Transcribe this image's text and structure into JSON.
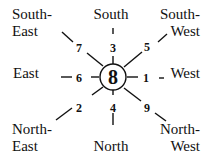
{
  "diagram": {
    "center": {
      "label": "8"
    },
    "directions": {
      "south_east": [
        "South-",
        "East"
      ],
      "south": "South",
      "south_west": [
        "South-",
        "West"
      ],
      "east": "East",
      "west": "West",
      "north_east": [
        "North-",
        "East"
      ],
      "north": "North",
      "north_west": [
        "North-",
        "West"
      ]
    },
    "numbers": {
      "south_east": "7",
      "south": "3",
      "south_west": "5",
      "east": "6",
      "west": "1",
      "north_east": "2",
      "north": "4",
      "north_west": "9"
    }
  }
}
